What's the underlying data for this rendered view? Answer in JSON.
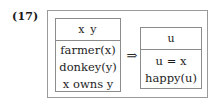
{
  "figure": {
    "example_number": "(17)",
    "implication_symbol": "⇒",
    "structure_type": "discourse-representation-structure",
    "colors": {
      "background": "#ffffff",
      "outer_box_border": "#9a9a9a",
      "inner_box_border": "#8c8c8c",
      "text": "#1d1d1d",
      "label_text": "#1a1a1a"
    }
  },
  "antecedent": {
    "universe": "x y",
    "conditions": [
      "farmer(x)",
      "donkey(y)",
      "x owns y"
    ]
  },
  "consequent": {
    "universe": "u",
    "conditions": [
      "u = x",
      "happy(u)"
    ]
  }
}
